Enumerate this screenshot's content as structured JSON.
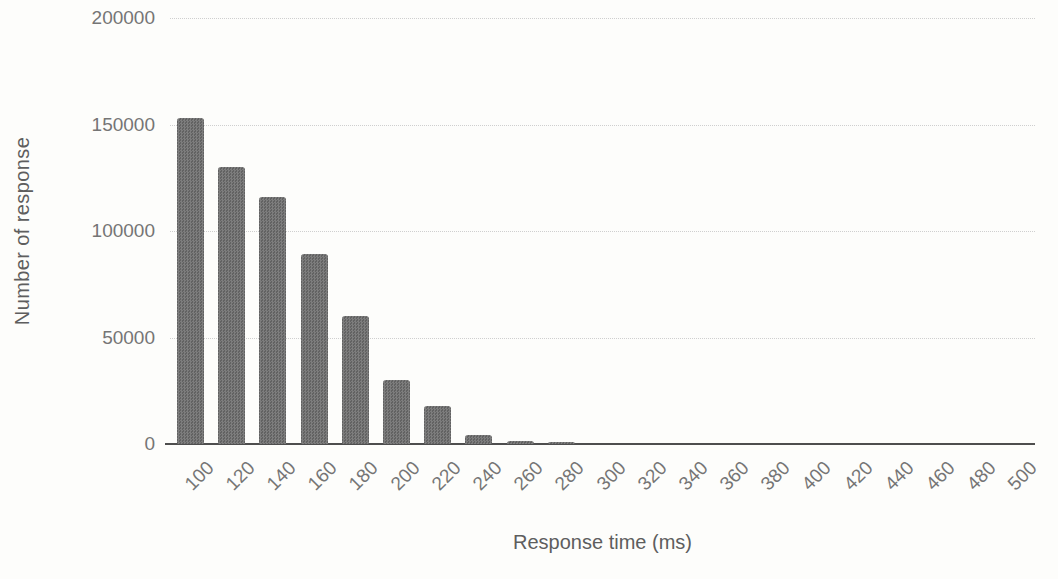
{
  "chart_data": {
    "type": "bar",
    "title": "",
    "xlabel": "Response time (ms)",
    "ylabel": "Number of response",
    "categories": [
      "100",
      "120",
      "140",
      "160",
      "180",
      "200",
      "220",
      "240",
      "260",
      "280",
      "300",
      "320",
      "340",
      "360",
      "380",
      "400",
      "420",
      "440",
      "460",
      "480",
      "500"
    ],
    "values": [
      153000,
      130000,
      116000,
      89000,
      60000,
      30000,
      18000,
      4000,
      1500,
      1000,
      0,
      0,
      0,
      0,
      0,
      0,
      0,
      0,
      0,
      0,
      0
    ],
    "ylim": [
      0,
      200000
    ],
    "yticks": [
      "0",
      "50000",
      "100000",
      "150000",
      "200000"
    ],
    "ytick_interval": 50000,
    "grid": "horizontal-dotted",
    "legend": "none",
    "bar_color": "#6f6f6f",
    "gridline_color": "#cfcfcf",
    "axis_line_color": "#4e4e4e",
    "tick_label_color": "#757575",
    "axis_title_color": "#5e5e5e",
    "background_color": "#fdfdfb"
  }
}
